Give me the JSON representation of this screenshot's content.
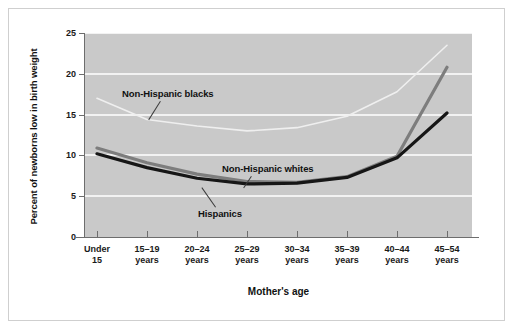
{
  "chart_data": {
    "type": "line",
    "title": "",
    "xlabel": "Mother's age",
    "ylabel": "Percent of newborns low in birth weight",
    "categories": [
      "Under 15",
      "15–19 years",
      "20–24 years",
      "25–29 years",
      "30–34 years",
      "35–39 years",
      "40–44 years",
      "45–54 years"
    ],
    "category_lines": [
      [
        "Under",
        "15"
      ],
      [
        "15–19",
        "years"
      ],
      [
        "20–24",
        "years"
      ],
      [
        "25–29",
        "years"
      ],
      [
        "30–34",
        "years"
      ],
      [
        "35–39",
        "years"
      ],
      [
        "40–44",
        "years"
      ],
      [
        "45–54",
        "years"
      ]
    ],
    "ylim": [
      0,
      25
    ],
    "yticks": [
      0,
      5,
      10,
      15,
      20,
      25
    ],
    "ytick_labels": [
      "0",
      "5",
      "10",
      "15",
      "20",
      "25"
    ],
    "grid": true,
    "grid_color": "#f2f2f2",
    "plot_background": "#c9c9c9",
    "legend_position": "inline-annotations",
    "series": [
      {
        "name": "Non-Hispanic blacks",
        "color": "#efefef",
        "width": 1.6,
        "values": [
          17.0,
          14.4,
          13.6,
          13.0,
          13.4,
          14.8,
          17.8,
          23.5
        ]
      },
      {
        "name": "Hispanics",
        "color": "#7d7d7d",
        "width": 3.2,
        "values": [
          10.9,
          9.1,
          7.7,
          6.8,
          6.7,
          7.4,
          9.9,
          20.8
        ]
      },
      {
        "name": "Non-Hispanic whites",
        "color": "#161616",
        "width": 3.2,
        "values": [
          10.2,
          8.5,
          7.2,
          6.5,
          6.6,
          7.3,
          9.7,
          15.2
        ]
      }
    ],
    "annotations": [
      {
        "text": "Non-Hispanic blacks",
        "x_px": 122,
        "y_px": 88,
        "leader": {
          "x1": 160,
          "y1": 101,
          "x2": 148,
          "y2": 120
        }
      },
      {
        "text": "Non-Hispanic whites",
        "x_px": 222,
        "y_px": 163,
        "leader": {
          "x1": 251,
          "y1": 176,
          "x2": 243,
          "y2": 188
        }
      },
      {
        "text": "Hispanics",
        "x_px": 198,
        "y_px": 208,
        "leader": {
          "x1": 216,
          "y1": 207,
          "x2": 202,
          "y2": 187
        }
      }
    ]
  },
  "figure": {
    "border_color": "#cfcfcf",
    "axis_color": "#6d6d6d",
    "background": "#ffffff"
  }
}
